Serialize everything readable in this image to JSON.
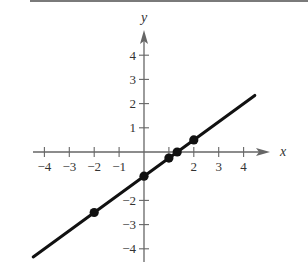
{
  "chart_data": {
    "type": "line",
    "title": "",
    "xlabel": "x",
    "ylabel": "y",
    "xlim": [
      -4.5,
      5
    ],
    "ylim": [
      -4.5,
      5
    ],
    "xticks": [
      -4,
      -3,
      -2,
      -1,
      1,
      2,
      3,
      4
    ],
    "yticks": [
      -4,
      -3,
      -2,
      1,
      2,
      3,
      4
    ],
    "xtick_labels": [
      "−4",
      "−3",
      "−2",
      "−1",
      "",
      "2",
      "3",
      "4"
    ],
    "ytick_labels": [
      "−4",
      "−3",
      "−2",
      "1",
      "2",
      "3",
      "4"
    ],
    "grid": false,
    "legend": null,
    "series": [
      {
        "name": "y = 0.75x - 1",
        "slope": 0.75,
        "intercept": -1,
        "line_x_range": [
          -4.45,
          4.45
        ],
        "color": "#111111"
      }
    ],
    "points": [
      {
        "x": -2,
        "y": -2.5
      },
      {
        "x": 0,
        "y": -1
      },
      {
        "x": 1,
        "y": -0.25
      },
      {
        "x": 1.333,
        "y": 0
      },
      {
        "x": 2,
        "y": 0.5
      }
    ]
  },
  "axes": {
    "x_label": "x",
    "y_label": "y",
    "axis_color": "#666666"
  }
}
